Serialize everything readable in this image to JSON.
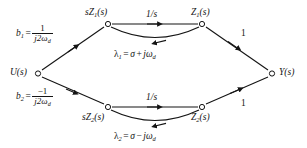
{
  "diagram": {
    "type": "signal-flow-graph",
    "background_color": "#ffffff",
    "line_color": "#141414",
    "node_fill": "#ffffff"
  },
  "nodes": {
    "input": {
      "id": "U",
      "label_html": "U(s)",
      "x": 36,
      "y": 73
    },
    "top_left": {
      "id": "sZ1",
      "label_html": "sZ<sub>1</sub>(s)",
      "x": 108,
      "y": 24
    },
    "top_right": {
      "id": "Z1",
      "label_html": "Z<sub>1</sub>(s)",
      "x": 202,
      "y": 24
    },
    "bottom_left": {
      "id": "sZ2",
      "label_html": "sZ<sub>2</sub>(s)",
      "x": 108,
      "y": 107
    },
    "bottom_right": {
      "id": "Z2",
      "label_html": "Z<sub>2</sub>(s)",
      "x": 202,
      "y": 107
    },
    "output": {
      "id": "Y",
      "label_html": "Y(s)",
      "x": 274,
      "y": 73
    }
  },
  "edges": {
    "u_to_top": {
      "from": "U",
      "to": "sZ1",
      "gain_b1_lead": "b",
      "gain_b1_sub": "1",
      "gain_numer": "1",
      "gain_denom_html": "j2&omega;<sub>d</sub>"
    },
    "u_to_bottom": {
      "from": "U",
      "to": "sZ2",
      "gain_b2_lead": "b",
      "gain_b2_sub": "2",
      "gain_numer": "−1",
      "gain_denom_html": "j2&omega;<sub>d</sub>"
    },
    "top_integrator": {
      "from": "sZ1",
      "to": "Z1",
      "gain_html": "1/s"
    },
    "bottom_integrator": {
      "from": "sZ2",
      "to": "Z2",
      "gain_html": "1/s"
    },
    "top_feedback": {
      "from": "Z1",
      "to": "sZ1",
      "gain_label": "lambda_1"
    },
    "bottom_feedback": {
      "from": "Z2",
      "to": "sZ2",
      "gain_label": "lambda_2"
    },
    "top_to_y": {
      "from": "Z1",
      "to": "Y",
      "gain_html": "1"
    },
    "bottom_to_y": {
      "from": "Z2",
      "to": "Y",
      "gain_html": "1"
    }
  },
  "equations": {
    "lambda1": {
      "lhs_lead": "λ",
      "lhs_sub": "1",
      "eq": "=",
      "term1": "σ",
      "op": "+",
      "term2_lead": "jω",
      "term2_sub": "d"
    },
    "lambda2": {
      "lhs_lead": "λ",
      "lhs_sub": "2",
      "eq": "=",
      "term1": "σ",
      "op": "−",
      "term2_lead": "jω",
      "term2_sub": "d"
    }
  },
  "gain_labels": {
    "one_top": "1",
    "one_bottom": "1",
    "inv_s_top": "1/s",
    "inv_s_bottom": "1/s"
  }
}
